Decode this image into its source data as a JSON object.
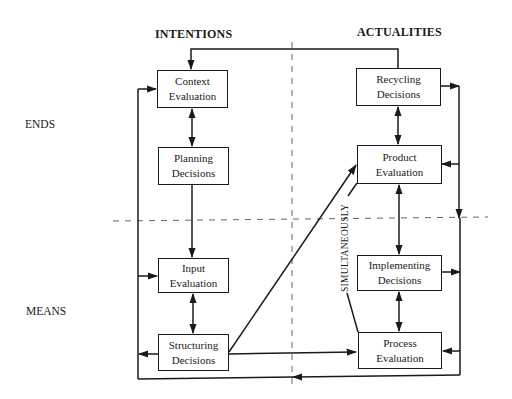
{
  "diagram": {
    "columns": {
      "left": "INTENTIONS",
      "right": "ACTUALITIES"
    },
    "rows": {
      "top": "ENDS",
      "bottom": "MEANS"
    },
    "boxes": {
      "context_evaluation": {
        "line1": "Context",
        "line2": "Evaluation"
      },
      "planning_decisions": {
        "line1": "Planning",
        "line2": "Decisions"
      },
      "input_evaluation": {
        "line1": "Input",
        "line2": "Evaluation"
      },
      "structuring_decisions": {
        "line1": "Structuring",
        "line2": "Decisions"
      },
      "recycling_decisions": {
        "line1": "Recycling",
        "line2": "Decisions"
      },
      "product_evaluation": {
        "line1": "Product",
        "line2": "Evaluation"
      },
      "implementing_decisions": {
        "line1": "Implementing",
        "line2": "Decisions"
      },
      "process_evaluation": {
        "line1": "Process",
        "line2": "Evaluation"
      }
    },
    "annotation": "SIMULTANEOUSLY",
    "colors": {
      "line": "#1a1a1a",
      "divider": "#666666",
      "background": "#ffffff"
    },
    "connections": [
      {
        "from": "Recycling Decisions",
        "to": "Context Evaluation",
        "type": "arrow"
      },
      {
        "from": "Context Evaluation",
        "to": "Planning Decisions",
        "type": "bidirectional"
      },
      {
        "from": "Planning Decisions",
        "to": "Input Evaluation",
        "type": "arrow"
      },
      {
        "from": "Input Evaluation",
        "to": "Structuring Decisions",
        "type": "bidirectional"
      },
      {
        "from": "Structuring Decisions",
        "to": "Product Evaluation",
        "type": "arrow"
      },
      {
        "from": "Structuring Decisions",
        "to": "Process Evaluation",
        "type": "arrow"
      },
      {
        "from": "Recycling Decisions",
        "to": "Product Evaluation",
        "type": "bidirectional"
      },
      {
        "from": "Product Evaluation",
        "to": "Implementing Decisions",
        "type": "bidirectional"
      },
      {
        "from": "Implementing Decisions",
        "to": "Process Evaluation",
        "type": "bidirectional"
      },
      {
        "from": "Recycling Decisions",
        "to": "right-feedback-loop",
        "type": "arrow"
      },
      {
        "from": "Implementing Decisions",
        "to": "right-feedback-loop",
        "type": "arrow"
      },
      {
        "from": "right-feedback-loop",
        "to": "Product Evaluation",
        "type": "arrow"
      },
      {
        "from": "right-feedback-loop",
        "to": "Process Evaluation",
        "type": "arrow"
      },
      {
        "from": "right-feedback-loop",
        "to": "left-feedback-loop",
        "type": "arrow"
      },
      {
        "from": "Structuring Decisions",
        "to": "left-feedback-loop",
        "type": "arrow"
      },
      {
        "from": "left-feedback-loop",
        "to": "Context Evaluation",
        "type": "arrow"
      },
      {
        "from": "left-feedback-loop",
        "to": "Input Evaluation",
        "type": "arrow"
      }
    ]
  }
}
